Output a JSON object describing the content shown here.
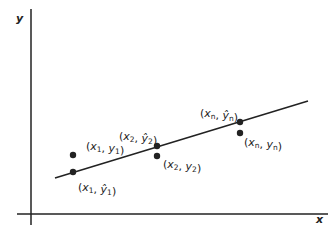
{
  "diagram": {
    "type": "linear-regression-residuals",
    "axes": {
      "x_label": "x",
      "y_label": "y"
    },
    "regression_line": {
      "x1": 55,
      "y1": 178,
      "x2": 308,
      "y2": 101
    },
    "points": [
      {
        "id": "obs-1",
        "cx": 73,
        "cy": 155,
        "label_var": "x",
        "label_sub": "1",
        "label_var2": "y",
        "label_sub2": "1",
        "hat": false,
        "lx": 86,
        "ly": 150
      },
      {
        "id": "fit-1",
        "cx": 73,
        "cy": 172,
        "label_var": "x",
        "label_sub": "1",
        "label_var2": "ŷ",
        "label_sub2": "1",
        "hat": true,
        "lx": 78,
        "ly": 191
      },
      {
        "id": "fit-2",
        "cx": 157,
        "cy": 146,
        "label_var": "x",
        "label_sub": "2",
        "label_var2": "ŷ",
        "label_sub2": "2",
        "hat": true,
        "lx": 119,
        "ly": 140
      },
      {
        "id": "obs-2",
        "cx": 157,
        "cy": 156,
        "label_var": "x",
        "label_sub": "2",
        "label_var2": "y",
        "label_sub2": "2",
        "hat": false,
        "lx": 163,
        "ly": 168
      },
      {
        "id": "fit-n",
        "cx": 240,
        "cy": 122,
        "label_var": "x",
        "label_sub": "n",
        "label_var2": "ŷ",
        "label_sub2": "n",
        "hat": true,
        "lx": 200,
        "ly": 117
      },
      {
        "id": "obs-n",
        "cx": 240,
        "cy": 133,
        "label_var": "x",
        "label_sub": "n",
        "label_var2": "y",
        "label_sub2": "n",
        "hat": false,
        "lx": 244,
        "ly": 146
      }
    ],
    "colors": {
      "ink": "#222222",
      "background": "#ffffff"
    }
  }
}
